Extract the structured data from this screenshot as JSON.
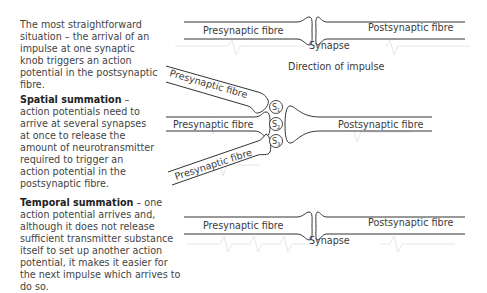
{
  "descriptions": {
    "single": {
      "text": "The most straightforward situation – the arrival of an impulse at one synaptic knob triggers an action potential in the postsynaptic fibre."
    },
    "spatial": {
      "term": "Spatial summation",
      "text": " – action potentials need to arrive at several synapses at once to release the amount of neurotransmitter required to trigger an action potential in the postsynaptic fibre."
    },
    "temporal": {
      "term": "Temporal summation",
      "text": " – one action potential arrives and, although it does not release sufficient transmitter substance itself to set up another action potential, it makes it easier for the next impulse which arrives to do so."
    }
  },
  "diagram": {
    "single": {
      "presynaptic_label": "Presynaptic fibre",
      "postsynaptic_label": "Postsynaptic fibre",
      "synapse_label": "Synapse"
    },
    "direction_label": "Direction of impulse",
    "spatial": {
      "presynaptic_top_label": "Presynaptic fibre",
      "presynaptic_middle_label": "Presynaptic fibre",
      "presynaptic_bottom_label": "Presynaptic fibre",
      "postsynaptic_label": "Postsynaptic fibre",
      "synapses": [
        {
          "label": "S",
          "sub": "1"
        },
        {
          "label": "S",
          "sub": "2"
        },
        {
          "label": "S",
          "sub": "3"
        }
      ]
    },
    "temporal": {
      "presynaptic_label": "Presynaptic fibre",
      "postsynaptic_label": "Postsynaptic fibre",
      "synapse_label": "Synapse"
    }
  },
  "colors": {
    "line": "#333333",
    "text": "#3a3a3a",
    "background_wave": "#e6e6e6"
  }
}
